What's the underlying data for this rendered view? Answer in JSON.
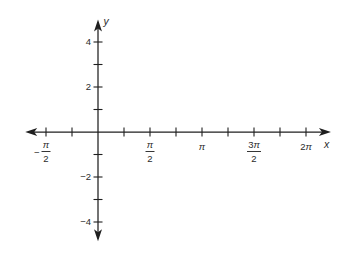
{
  "figure": {
    "background": "#ffffff",
    "axis_color": "#1f1f1f",
    "text_color": "#2b2b2b"
  },
  "chart_data": {
    "type": "line",
    "series": [],
    "title": "",
    "xlabel": "x",
    "ylabel": "y",
    "xlim_pi": [
      -0.7,
      2.24
    ],
    "ylim": [
      -4.85,
      5.0
    ],
    "x_tick_step_pi": 0.25,
    "x_ticks_pi": [
      -0.5,
      -0.25,
      0.25,
      0.5,
      0.75,
      1,
      1.25,
      1.5,
      1.75,
      2
    ],
    "x_tick_labels": [
      {
        "pi": -0.5,
        "style": "fraction",
        "sign": "−",
        "num": "π",
        "den": "2"
      },
      {
        "pi": 0.5,
        "style": "fraction",
        "sign": "",
        "num": "π",
        "den": "2"
      },
      {
        "pi": 1,
        "style": "inline",
        "text": "π"
      },
      {
        "pi": 1.5,
        "style": "fraction",
        "sign": "",
        "num": "3π",
        "den": "2"
      },
      {
        "pi": 2,
        "style": "inline",
        "text": "2π"
      }
    ],
    "y_ticks": [
      -4,
      -3,
      -2,
      -1,
      1,
      2,
      3,
      4
    ],
    "y_tick_labels": [
      {
        "value": 4,
        "text": "4"
      },
      {
        "value": 2,
        "text": "2"
      },
      {
        "value": -2,
        "text": "−2"
      },
      {
        "value": -4,
        "text": "−4"
      }
    ],
    "grid": false,
    "legend": false
  }
}
